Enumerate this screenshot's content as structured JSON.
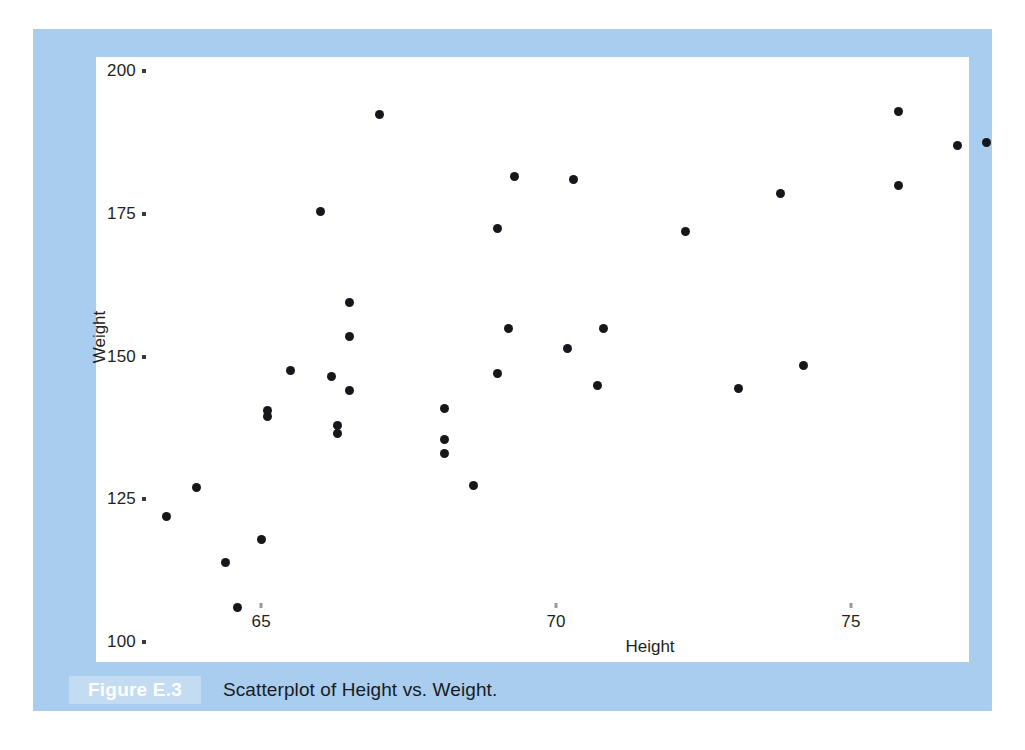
{
  "figure": {
    "badge_label": "Figure E.3",
    "caption": "Scatterplot of Height vs. Weight.",
    "card_background": "#a8cdee",
    "panel_background": "#ffffff",
    "badge_background": "#c3dcf2",
    "point_color": "#17161a"
  },
  "chart_data": {
    "type": "scatter",
    "title": "",
    "xlabel": "Height",
    "ylabel": "Weight",
    "xlim": [
      62.2,
      77.0
    ],
    "ylim": [
      96.5,
      202.5
    ],
    "xticks": [
      65,
      70,
      75
    ],
    "yticks": [
      100,
      125,
      150,
      175,
      200
    ],
    "xtick_labels": [
      "65",
      "70",
      "75"
    ],
    "ytick_labels": [
      "100",
      "125",
      "150",
      "175",
      "200"
    ],
    "grid": false,
    "legend": null,
    "series": [
      {
        "name": "Height vs Weight",
        "marker": "filled-circle",
        "color": "#17161a",
        "points": [
          {
            "x": 63.4,
            "y": 122.0
          },
          {
            "x": 63.9,
            "y": 127.0
          },
          {
            "x": 64.4,
            "y": 114.0
          },
          {
            "x": 64.6,
            "y": 106.0
          },
          {
            "x": 65.0,
            "y": 118.0
          },
          {
            "x": 65.1,
            "y": 139.5
          },
          {
            "x": 65.1,
            "y": 140.5
          },
          {
            "x": 65.5,
            "y": 147.5
          },
          {
            "x": 66.0,
            "y": 175.5
          },
          {
            "x": 66.2,
            "y": 146.5
          },
          {
            "x": 66.5,
            "y": 159.5
          },
          {
            "x": 66.5,
            "y": 153.5
          },
          {
            "x": 66.5,
            "y": 144.0
          },
          {
            "x": 66.3,
            "y": 138.0
          },
          {
            "x": 66.3,
            "y": 136.5
          },
          {
            "x": 67.0,
            "y": 192.5
          },
          {
            "x": 68.1,
            "y": 141.0
          },
          {
            "x": 68.1,
            "y": 135.5
          },
          {
            "x": 68.1,
            "y": 133.0
          },
          {
            "x": 68.6,
            "y": 127.5
          },
          {
            "x": 69.3,
            "y": 181.5
          },
          {
            "x": 69.0,
            "y": 172.5
          },
          {
            "x": 69.2,
            "y": 155.0
          },
          {
            "x": 69.0,
            "y": 147.0
          },
          {
            "x": 70.3,
            "y": 181.0
          },
          {
            "x": 70.2,
            "y": 151.5
          },
          {
            "x": 70.8,
            "y": 155.0
          },
          {
            "x": 70.7,
            "y": 145.0
          },
          {
            "x": 72.2,
            "y": 172.0
          },
          {
            "x": 73.8,
            "y": 178.5
          },
          {
            "x": 73.1,
            "y": 144.5
          },
          {
            "x": 74.2,
            "y": 148.5
          },
          {
            "x": 75.8,
            "y": 193.0
          },
          {
            "x": 75.8,
            "y": 180.0
          },
          {
            "x": 76.8,
            "y": 187.0
          },
          {
            "x": 77.3,
            "y": 187.5
          }
        ]
      }
    ]
  }
}
